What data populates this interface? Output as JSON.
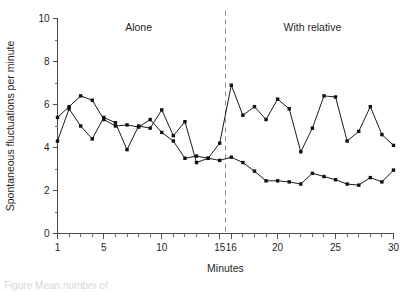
{
  "figure": {
    "caption_fragment": "Figure   Mean number of"
  },
  "chart_data": {
    "type": "line",
    "title": "",
    "xlabel": "Minutes",
    "ylabel": "Spontaneous fluctuations per minute",
    "xlim": [
      1,
      30
    ],
    "ylim": [
      0,
      10
    ],
    "grid": false,
    "legend_position": "none",
    "x_ticks_major": [
      1,
      5,
      10,
      15,
      16,
      20,
      25,
      30
    ],
    "x_tick_labels": [
      "1",
      "5",
      "10",
      "15",
      "16",
      "20",
      "25",
      "30"
    ],
    "y_ticks_major": [
      0,
      2,
      4,
      6,
      8,
      10
    ],
    "y_tick_labels": [
      "0",
      "2",
      "4",
      "6",
      "8",
      "10"
    ],
    "y_ticks_minor": [
      1,
      3,
      5,
      7,
      9
    ],
    "annotations": [
      {
        "text": "Alone",
        "x": 8,
        "y": 9.4
      },
      {
        "text": "With relative",
        "x": 23,
        "y": 9.4
      }
    ],
    "divider": {
      "x": 15.5,
      "style": "dashed"
    },
    "x": [
      1,
      2,
      3,
      4,
      5,
      6,
      7,
      8,
      9,
      10,
      11,
      12,
      13,
      14,
      15,
      16,
      17,
      18,
      19,
      20,
      21,
      22,
      23,
      24,
      25,
      26,
      27,
      28,
      29,
      30
    ],
    "series": [
      {
        "name": "Series A",
        "values": [
          5.4,
          5.9,
          6.4,
          6.2,
          5.3,
          5.0,
          5.05,
          4.95,
          5.3,
          4.7,
          4.3,
          3.5,
          3.6,
          3.5,
          4.2,
          6.9,
          5.5,
          5.9,
          5.3,
          6.25,
          5.8,
          3.8,
          4.9,
          6.4,
          6.35,
          4.3,
          4.75,
          5.9,
          4.6,
          4.1
        ]
      },
      {
        "name": "Series B",
        "values": [
          4.3,
          5.8,
          5.0,
          4.4,
          5.4,
          5.15,
          3.9,
          5.0,
          4.9,
          5.75,
          4.55,
          5.2,
          3.3,
          3.5,
          3.4,
          3.55,
          3.3,
          2.9,
          2.45,
          2.45,
          2.4,
          2.3,
          2.8,
          2.65,
          2.5,
          2.3,
          2.25,
          2.6,
          2.4,
          2.95
        ]
      }
    ]
  }
}
